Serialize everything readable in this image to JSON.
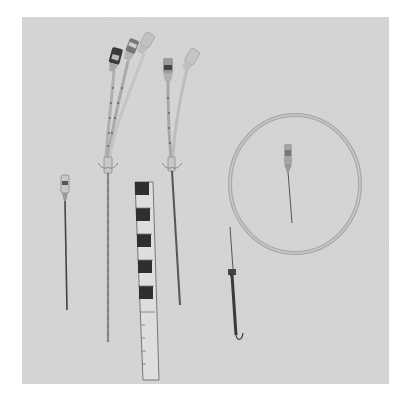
{
  "image": {
    "description": "Grayscale photograph of a central venous catheter kit on a light gray background",
    "background_color": "#d6d6d6",
    "page_color": "#ffffff",
    "items": [
      {
        "name": "introducer-needle",
        "label": "Introducer needle"
      },
      {
        "name": "triple-lumen-catheter",
        "label": "Triple-lumen catheter"
      },
      {
        "name": "measuring-scale",
        "label": "Measuring scale with black squares"
      },
      {
        "name": "double-lumen-catheter",
        "label": "Double-lumen catheter"
      },
      {
        "name": "coiled-guidewire",
        "label": "Coiled guidewire with J-tip"
      },
      {
        "name": "small-needle",
        "label": "Small needle inside coil"
      }
    ]
  }
}
